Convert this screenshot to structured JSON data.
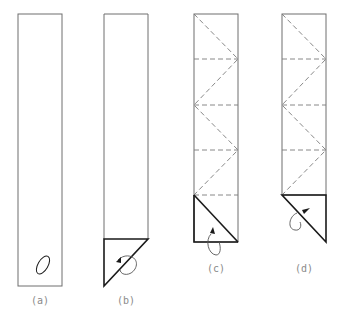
{
  "figure": {
    "panels": [
      {
        "id": "a",
        "label": "(a)",
        "description": "Long paper strip with an ellipse marking near the bottom"
      },
      {
        "id": "b",
        "label": "(b)",
        "description": "Bottom corner folded up into a triangle with rotation arrow"
      },
      {
        "id": "c",
        "label": "(c)",
        "description": "Strip with dashed horizontal and zigzag diagonal crease lines; bottom square with diagonal"
      },
      {
        "id": "d",
        "label": "(d)",
        "description": "Strip with dashed creases; bottom triangle folded with rotation arrow"
      }
    ],
    "colors": {
      "outline": "#6e6e6e",
      "bold_edge": "#1a1a1a",
      "dashed": "#7a7a7a",
      "label": "#8a8a8a"
    }
  }
}
